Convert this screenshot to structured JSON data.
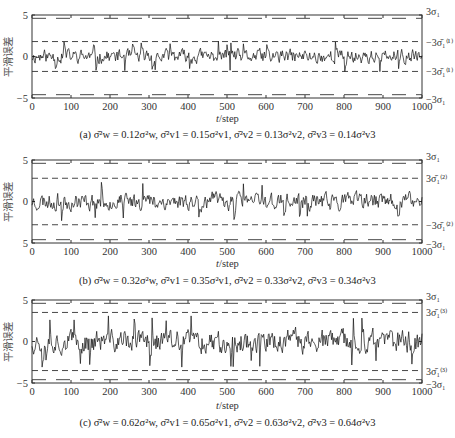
{
  "figure": {
    "ylabel": "平滑误差",
    "xlabel_italic": "t",
    "xlabel_rest": "/step",
    "panels": [
      {
        "id": "a",
        "caption": "(a)  σ̄²w = 0.12σ²w, σ̄²v1 = 0.15σ²v1, σ̄²v2 = 0.13σ²v2, σ̄²v3 = 0.14σ²v3",
        "right_labels": {
          "outer_top": "3σ₁",
          "inner_top": "−3σ̄₁⁽¹⁾",
          "inner_bottom": "−3σ̄₁⁽¹⁾",
          "outer_bottom": "−3σ₁"
        },
        "y_ticks": [
          "5",
          "0",
          "−5"
        ]
      },
      {
        "id": "b",
        "caption": "(b)  σ̄²w = 0.32σ²w, σ̄²v1 = 0.35σ²v1, σ̄²v2 = 0.33σ²v2, σ̄²v3 = 0.34σ²v3",
        "right_labels": {
          "outer_top": "3σ₁",
          "inner_top": "3σ̄₁⁽²⁾",
          "inner_bottom": "−3σ̄₁⁽²⁾",
          "outer_bottom": "−3σ₁"
        },
        "y_ticks": [
          "5",
          "0",
          "5"
        ]
      },
      {
        "id": "c",
        "caption": "(c)  σ̄²w = 0.62σ²w, σ̄²v1 = 0.65σ²v1, σ̄²v2 = 0.63σ²v2, σ̄²v3 = 0.64σ²v3",
        "right_labels": {
          "outer_top": "3σ₁",
          "inner_top": "3σ̄₁⁽³⁾",
          "inner_bottom": "3σ̄₁⁽³⁾",
          "outer_bottom": "−3σ₁"
        },
        "y_ticks": [
          "5",
          "0",
          "−5"
        ]
      }
    ],
    "x_ticks": [
      "0",
      "100",
      "200",
      "300",
      "400",
      "500",
      "600",
      "700",
      "800",
      "900",
      "1000"
    ]
  },
  "chart_data": [
    {
      "type": "line",
      "title": "(a) σ̄²w = 0.12σ²w, σ̄²v1 = 0.15σ²v1, σ̄²v2 = 0.13σ²v2, σ̄²v3 = 0.14σ²v3",
      "xlabel": "t/step",
      "ylabel": "平滑误差",
      "xlim": [
        0,
        1000
      ],
      "ylim": [
        -5,
        5
      ],
      "x_ticks": [
        0,
        100,
        200,
        300,
        400,
        500,
        600,
        700,
        800,
        900,
        1000
      ],
      "y_ticks": [
        -5,
        0,
        5
      ],
      "series": [
        {
          "name": "smoothing error",
          "style": "solid",
          "description": "noise around 0, amplitude ≈ ±1.7",
          "amplitude": 1.7,
          "seed": 11
        },
        {
          "name": "3σ₁",
          "style": "long-dash",
          "value": 4.6
        },
        {
          "name": "-3σ₁",
          "style": "long-dash",
          "value": -4.6
        },
        {
          "name": "3σ̄₁(1)",
          "style": "dash",
          "value": 1.8
        },
        {
          "name": "-3σ̄₁(1)",
          "style": "dash",
          "value": -1.8
        }
      ],
      "grid": false,
      "legend": "right-side labels"
    },
    {
      "type": "line",
      "title": "(b) σ̄²w = 0.32σ²w, σ̄²v1 = 0.35σ²v1, σ̄²v2 = 0.33σ²v2, σ̄²v3 = 0.34σ²v3",
      "xlabel": "t/step",
      "ylabel": "平滑误差",
      "xlim": [
        0,
        1000
      ],
      "ylim": [
        -5,
        5
      ],
      "x_ticks": [
        0,
        100,
        200,
        300,
        400,
        500,
        600,
        700,
        800,
        900,
        1000
      ],
      "y_ticks": [
        -5,
        0,
        5
      ],
      "series": [
        {
          "name": "smoothing error",
          "style": "solid",
          "description": "noise around 0, amplitude ≈ ±2.2",
          "amplitude": 2.1,
          "seed": 23
        },
        {
          "name": "3σ₁",
          "style": "long-dash",
          "value": 4.6
        },
        {
          "name": "-3σ₁",
          "style": "long-dash",
          "value": -4.6
        },
        {
          "name": "3σ̄₁(2)",
          "style": "dash",
          "value": 2.8
        },
        {
          "name": "-3σ̄₁(2)",
          "style": "dash",
          "value": -2.8
        }
      ],
      "grid": false,
      "legend": "right-side labels"
    },
    {
      "type": "line",
      "title": "(c) σ̄²w = 0.62σ²w, σ̄²v1 = 0.65σ²v1, σ̄²v2 = 0.63σ²v2, σ̄²v3 = 0.64σ²v3",
      "xlabel": "t/step",
      "ylabel": "平滑误差",
      "xlim": [
        0,
        1000
      ],
      "ylim": [
        -5,
        5
      ],
      "x_ticks": [
        0,
        100,
        200,
        300,
        400,
        500,
        600,
        700,
        800,
        900,
        1000
      ],
      "y_ticks": [
        -5,
        0,
        5
      ],
      "series": [
        {
          "name": "smoothing error",
          "style": "solid",
          "description": "noise around 0, amplitude ≈ ±3",
          "amplitude": 2.8,
          "seed": 37
        },
        {
          "name": "3σ₁",
          "style": "long-dash",
          "value": 4.6
        },
        {
          "name": "-3σ₁",
          "style": "long-dash",
          "value": -4.6
        },
        {
          "name": "3σ̄₁(3)",
          "style": "dash",
          "value": 3.5
        },
        {
          "name": "-3σ̄₁(3)",
          "style": "dash",
          "value": -3.5
        }
      ],
      "grid": false,
      "legend": "right-side labels"
    }
  ]
}
